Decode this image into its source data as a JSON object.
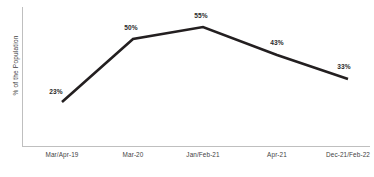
{
  "chart_data": {
    "type": "line",
    "title": "",
    "subtitle": "",
    "xlabel": "",
    "ylabel": "% of  the Population",
    "categories": [
      "Mar/Apr-19",
      "Mar-20",
      "Jan/Feb-21",
      "Apr-21",
      "Dec-21/Feb-22"
    ],
    "values": [
      23,
      50,
      55,
      43,
      33
    ],
    "data_labels": [
      "23%",
      "50%",
      "55%",
      "43%",
      "33%"
    ],
    "ylim": [
      0,
      60
    ],
    "grid": false,
    "legend": false,
    "y_tick_labels": [],
    "series": [
      {
        "name": "% of the Population",
        "values": [
          23,
          50,
          55,
          43,
          33
        ],
        "color": "#231f20"
      }
    ]
  },
  "style": {
    "line_color": "#231f20",
    "axis_color": "#bfbfbf",
    "label_color": "#2b2b2b",
    "tick_color": "#3f3f3f",
    "background": "#ffffff"
  },
  "geometry": {
    "points": [
      {
        "x": 62,
        "y": 102,
        "label_x": 56,
        "label_y": 88
      },
      {
        "x": 133,
        "y": 39,
        "label_x": 131,
        "label_y": 24
      },
      {
        "x": 203,
        "y": 27,
        "label_x": 201,
        "label_y": 12
      },
      {
        "x": 277,
        "y": 55,
        "label_x": 277,
        "label_y": 39
      },
      {
        "x": 348,
        "y": 79,
        "label_x": 344,
        "label_y": 63
      }
    ],
    "tick_x": [
      62,
      133,
      203,
      277,
      348
    ],
    "axis_path": "M 22.5 7 L 22.5 146.5 L 370 146.5",
    "line_path": "M 62 102 L 133 39 L 203 27 L 277 55 L 348 79"
  }
}
